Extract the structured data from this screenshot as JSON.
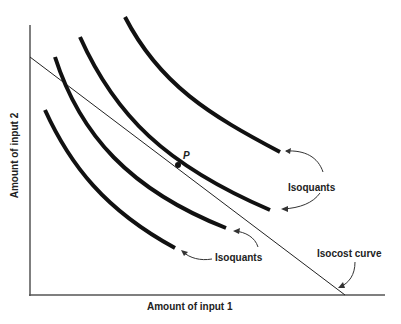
{
  "diagram": {
    "axes": {
      "x_label": "Amount of input 1",
      "y_label": "Amount of input 2"
    },
    "point_label": "P",
    "annotations": {
      "isoquants_upper": "Isoquants",
      "isoquants_lower": "Isoquants",
      "isocost": "Isocost curve"
    },
    "curves": [
      {
        "name": "isoquant-1",
        "points": [
          [
            45,
            110
          ],
          [
            70,
            160
          ],
          [
            100,
            200
          ],
          [
            140,
            232
          ],
          [
            175,
            248
          ]
        ]
      },
      {
        "name": "isoquant-2",
        "points": [
          [
            55,
            57
          ],
          [
            75,
            110
          ],
          [
            110,
            160
          ],
          [
            160,
            198
          ],
          [
            226,
            228
          ]
        ]
      },
      {
        "name": "isoquant-3",
        "points": [
          [
            80,
            37
          ],
          [
            110,
            90
          ],
          [
            145,
            135
          ],
          [
            178,
            165
          ],
          [
            220,
            188
          ],
          [
            270,
            210
          ]
        ]
      },
      {
        "name": "isoquant-4",
        "points": [
          [
            125,
            17
          ],
          [
            155,
            60
          ],
          [
            200,
            100
          ],
          [
            240,
            128
          ],
          [
            280,
            152
          ]
        ]
      },
      {
        "name": "isocost-line",
        "points": [
          [
            30,
            57
          ],
          [
            345,
            295
          ]
        ]
      }
    ],
    "tangent_point": {
      "x": 178,
      "y": 165
    },
    "colors": {
      "curve": "#111111",
      "axis": "#444444",
      "text": "#222222",
      "background": "#ffffff"
    }
  }
}
